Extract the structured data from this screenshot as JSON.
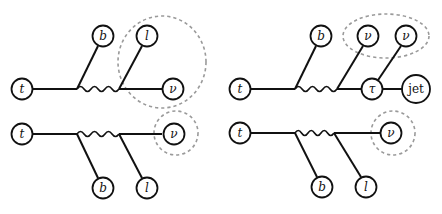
{
  "diagrams": [
    {
      "id": "top-left",
      "nodes": {
        "t": "t",
        "b": "b",
        "l": "l",
        "nu": "ν"
      },
      "grouping": "l and ν enclosed in dashed circle"
    },
    {
      "id": "bottom-left",
      "nodes": {
        "t": "t",
        "b": "b",
        "l": "l",
        "nu": "ν"
      },
      "grouping": "ν enclosed in dashed circle"
    },
    {
      "id": "top-right",
      "nodes": {
        "t": "t",
        "b": "b",
        "nu1": "ν",
        "nu2": "ν",
        "tau": "τ",
        "jet": "jet"
      },
      "grouping": "two ν enclosed in dashed ellipse"
    },
    {
      "id": "bottom-right",
      "nodes": {
        "t": "t",
        "b": "b",
        "l": "l",
        "nu": "ν"
      },
      "grouping": "ν enclosed in dashed circle"
    }
  ]
}
